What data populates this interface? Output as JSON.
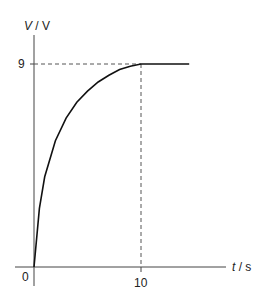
{
  "chart_data": {
    "type": "line",
    "title": "",
    "xlabel_var": "t",
    "xlabel_unit": "s",
    "ylabel_var": "V",
    "ylabel_unit": "V",
    "xlabel": "t / s",
    "ylabel": "V / V",
    "x_ticks": [
      "0",
      "10"
    ],
    "y_ticks": [
      "9"
    ],
    "origin_label": "0",
    "xlim": [
      0,
      15
    ],
    "ylim": [
      0,
      10
    ],
    "grid": false,
    "series": [
      {
        "name": "V",
        "description": "charging curve rising from 0 and levelling off at 9 V at t = 10 s",
        "x": [
          0,
          0.5,
          1,
          2,
          3,
          4,
          5,
          6,
          7,
          8,
          9,
          10,
          12,
          14.5
        ],
        "values": [
          0,
          2.6,
          4.0,
          5.6,
          6.6,
          7.3,
          7.8,
          8.2,
          8.5,
          8.75,
          8.9,
          9.0,
          9.0,
          9.0
        ]
      }
    ],
    "annotations": [
      {
        "type": "dashed-line",
        "from": [
          0,
          9
        ],
        "to": [
          10,
          9
        ]
      },
      {
        "type": "dashed-line",
        "from": [
          10,
          0
        ],
        "to": [
          10,
          9
        ]
      }
    ]
  }
}
